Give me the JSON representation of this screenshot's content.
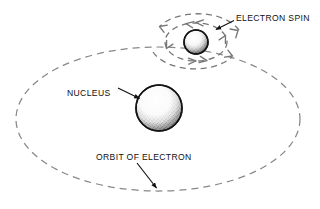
{
  "figure": {
    "background_color": "#ffffff",
    "line_color": "#777777",
    "text_color": "#111111",
    "sphere_outline_color": "#1a1a1a"
  },
  "labels": {
    "electron_spin": "ELECTRON SPIN",
    "nucleus": "NUCLEUS",
    "orbit_of_electron": "ORBIT OF ELECTRON"
  },
  "diagram_data": {
    "type": "diagram",
    "elements": [
      {
        "name": "orbit-ellipse",
        "shape": "ellipse",
        "style": "dashed",
        "center": [
          158,
          119
        ],
        "radius_x": 142,
        "radius_y": 72,
        "label": "ORBIT OF ELECTRON"
      },
      {
        "name": "nucleus-sphere",
        "shape": "circle",
        "style": "stippled-shaded",
        "center": [
          159,
          108
        ],
        "radius": 23,
        "label": "NUCLEUS"
      },
      {
        "name": "electron-sphere",
        "shape": "circle",
        "style": "stippled-shaded",
        "center": [
          196,
          42
        ],
        "radius": 12,
        "label": "ELECTRON"
      },
      {
        "name": "spin-inner-ellipse",
        "shape": "ellipse",
        "style": "dashed-with-arrowheads",
        "center": [
          196,
          42
        ],
        "radius_x": 31,
        "radius_y": 19,
        "rotation_direction": "counterclockwise",
        "label": "ELECTRON SPIN"
      },
      {
        "name": "spin-outer-ellipse",
        "shape": "ellipse",
        "style": "dashed-with-arrowheads",
        "center": [
          196,
          42
        ],
        "radius_x": 45,
        "radius_y": 27,
        "rotation_direction": "counterclockwise",
        "label": "ELECTRON SPIN"
      }
    ],
    "leader_lines": [
      {
        "name": "electron-spin-leader",
        "from_label": "ELECTRON SPIN",
        "from": [
          234,
          20
        ],
        "to": [
          215,
          30
        ],
        "arrowhead": "at-target"
      },
      {
        "name": "nucleus-leader",
        "from_label": "NUCLEUS",
        "from": [
          117,
          88
        ],
        "to": [
          140,
          99
        ],
        "arrowhead": "at-target"
      },
      {
        "name": "orbit-leader",
        "from_label": "ORBIT OF ELECTRON",
        "from": [
          137,
          163
        ],
        "to": [
          157,
          189
        ],
        "arrowhead": "at-target"
      }
    ]
  }
}
